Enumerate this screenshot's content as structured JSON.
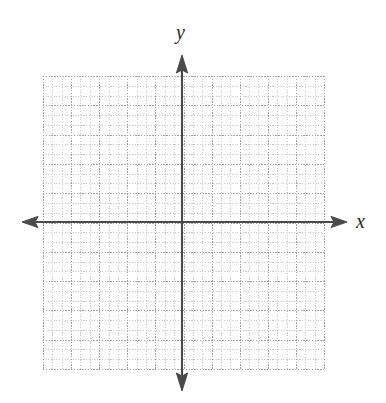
{
  "figure": {
    "kind": "blank-cartesian-coordinate-plane",
    "background_color": "#ffffff"
  },
  "axes": {
    "x_label": "x",
    "y_label": "y",
    "color": "#4a4a4a",
    "line_width_px": 2,
    "origin": {
      "x_px": 182,
      "y_px": 222
    },
    "arrowheads": [
      "left",
      "right",
      "up",
      "down"
    ],
    "x_axis": {
      "start_px": 22,
      "end_px": 347,
      "y_px": 222
    },
    "y_axis": {
      "start_px": 55,
      "end_px": 391,
      "x_px": 182
    }
  },
  "grid": {
    "style": "dotted",
    "major_color": "#a0a0a0",
    "minor_color": "#c8c8c8",
    "left_px": 43,
    "top_px": 76,
    "width_px": 281,
    "height_px": 293,
    "major_columns": 10,
    "major_rows": 10,
    "minor_per_major": 3
  },
  "chart_data": {
    "type": "scatter",
    "title": "",
    "xlabel": "x",
    "ylabel": "y",
    "series": [],
    "x": [],
    "values": [],
    "xlim": [
      -5,
      5
    ],
    "ylim": [
      -5,
      5
    ],
    "xticklabels": [],
    "yticklabels": [],
    "grid": true,
    "legend": "none",
    "annotations": []
  }
}
